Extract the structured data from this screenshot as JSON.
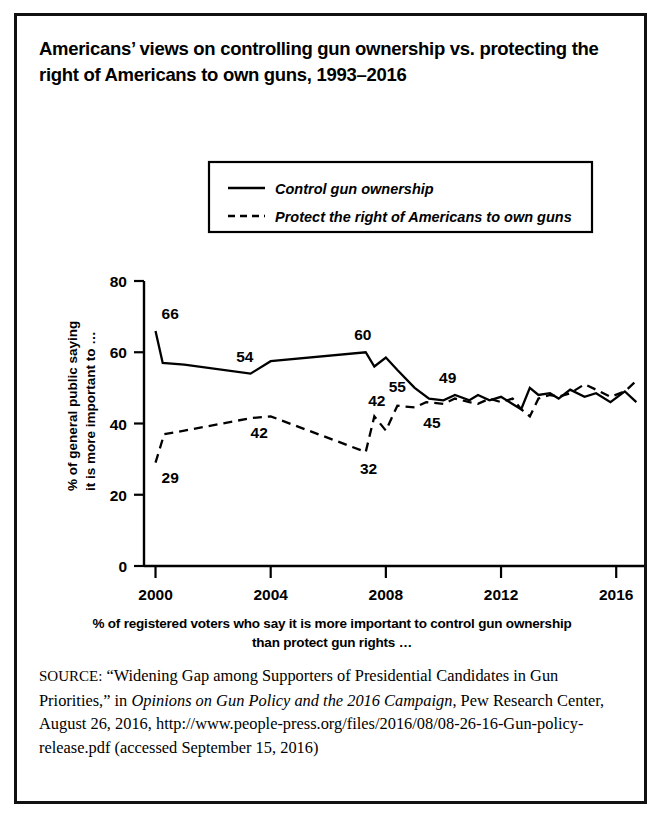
{
  "figure": {
    "title": "Americans’ views on controlling gun ownership vs. protecting the right of Americans to own guns, 1993–2016",
    "x_caption": "% of registered voters who say it is more important to control gun ownership than protect gun rights …",
    "source_label": "SOURCE:",
    "source_part1": " “Widening Gap among Supporters of Presidential Candidates in Gun Priorities,” in ",
    "source_italic": "Opinions on Gun Policy and the 2016 Campaign",
    "source_part2": ", Pew Research Center, August 26, 2016, http://www.people-press.org/files/2016/08/08-26-16-Gun-policy-release.pdf (accessed September 15, 2016)",
    "border_color": "#111111",
    "line_color": "#000000"
  },
  "chart_data": {
    "type": "line",
    "title": "Americans’ views on controlling gun ownership vs. protecting the right of Americans to own guns, 1993–2016",
    "xlabel": "% of registered voters who say it is more important to control gun ownership than protect gun rights …",
    "ylabel": "% of general public saying it is more important to …",
    "ylabel_line1": "% of general public saying",
    "ylabel_line2": "it is more important to …",
    "xlim": [
      1999.6,
      2017.0
    ],
    "ylim": [
      0,
      80
    ],
    "yticks": [
      0,
      20,
      40,
      60,
      80
    ],
    "xticks": [
      2000,
      2004,
      2008,
      2012,
      2016
    ],
    "grid": false,
    "legend_position": "top-center",
    "series": [
      {
        "name": "Control gun ownership",
        "style": "solid",
        "x": [
          2000.0,
          2000.25,
          2001.0,
          2003.3,
          2004.0,
          2007.3,
          2007.6,
          2008.0,
          2008.4,
          2009.0,
          2009.5,
          2010.0,
          2010.4,
          2010.9,
          2011.2,
          2011.6,
          2012.0,
          2012.4,
          2012.7,
          2013.0,
          2013.3,
          2013.7,
          2014.0,
          2014.4,
          2014.9,
          2015.3,
          2015.8,
          2016.3,
          2016.7
        ],
        "values": [
          66,
          57,
          56.5,
          54,
          57.5,
          60,
          56,
          58.5,
          55,
          50,
          47,
          46.5,
          48,
          46.5,
          48,
          46.5,
          47.5,
          45.5,
          44,
          50,
          48,
          48.5,
          47,
          49.5,
          47.5,
          48.5,
          46,
          49,
          46
        ]
      },
      {
        "name": "Protect the right of Americans to own guns",
        "style": "dashed",
        "x": [
          2000.0,
          2000.3,
          2001.0,
          2003.3,
          2004.0,
          2007.3,
          2007.6,
          2008.0,
          2008.4,
          2009.0,
          2009.4,
          2010.0,
          2010.4,
          2010.9,
          2011.2,
          2011.6,
          2012.0,
          2012.4,
          2012.7,
          2013.0,
          2013.3,
          2013.7,
          2014.0,
          2014.4,
          2014.9,
          2015.3,
          2015.8,
          2016.3,
          2016.7
        ],
        "values": [
          29,
          37,
          38,
          41.5,
          42,
          32,
          42,
          38,
          45,
          44.5,
          46,
          45.5,
          47,
          46,
          45.5,
          47,
          46,
          47,
          44,
          42,
          47,
          48,
          47.5,
          48.5,
          51,
          49.5,
          47.5,
          49,
          52
        ]
      }
    ],
    "point_labels": [
      {
        "text": "66",
        "year": 2000.0,
        "value": 66,
        "series": "Control gun ownership",
        "anchor": "left-above"
      },
      {
        "text": "54",
        "year": 2003.1,
        "value": 54,
        "series": "Control gun ownership",
        "anchor": "above"
      },
      {
        "text": "60",
        "year": 2007.2,
        "value": 60,
        "series": "Control gun ownership",
        "anchor": "above"
      },
      {
        "text": "55",
        "year": 2008.4,
        "value": 55,
        "series": "Control gun ownership",
        "anchor": "below"
      },
      {
        "text": "49",
        "year": 2009.5,
        "value": 49,
        "series": "Control gun ownership",
        "anchor": "above-right"
      },
      {
        "text": "46",
        "year": 2016.7,
        "value": 46,
        "series": "Control gun ownership",
        "anchor": "right-below"
      },
      {
        "text": "29",
        "year": 2000.0,
        "value": 29,
        "series": "Protect the right of Americans to own guns",
        "anchor": "left-below"
      },
      {
        "text": "42",
        "year": 2003.6,
        "value": 42,
        "series": "Protect the right of Americans to own guns",
        "anchor": "below"
      },
      {
        "text": "32",
        "year": 2007.4,
        "value": 32,
        "series": "Protect the right of Americans to own guns",
        "anchor": "below"
      },
      {
        "text": "42",
        "year": 2008.4,
        "value": 42,
        "series": "Protect the right of Americans to own guns",
        "anchor": "above-left"
      },
      {
        "text": "45",
        "year": 2009.6,
        "value": 45,
        "series": "Protect the right of Americans to own guns",
        "anchor": "below"
      },
      {
        "text": "52",
        "year": 2016.7,
        "value": 52,
        "series": "Protect the right of Americans to own guns",
        "anchor": "right-above"
      }
    ],
    "legend": [
      {
        "label": "Control gun ownership",
        "style": "solid"
      },
      {
        "label": "Protect the right of Americans to own guns",
        "style": "dashed"
      }
    ]
  }
}
